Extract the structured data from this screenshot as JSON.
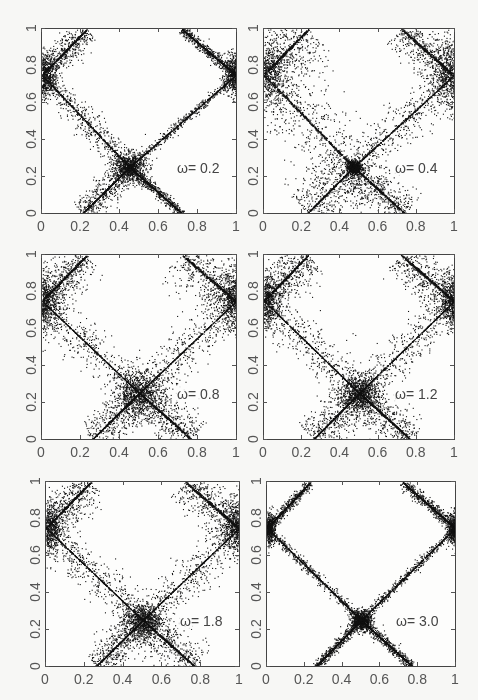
{
  "figure": {
    "background": "#f7f7f5",
    "ink": "#111111",
    "axis_color": "#444444"
  },
  "chart_data": [
    {
      "type": "scatter",
      "title": "",
      "annotation": "ω= 0.2",
      "omega": 0.2,
      "xlim": [
        0,
        1
      ],
      "ylim": [
        0,
        1
      ],
      "xticks": [
        "0",
        "0.2",
        "0.4",
        "0.6",
        "0.8",
        "1"
      ],
      "yticks": [
        "0",
        "0.2",
        "0.4",
        "0.6",
        "0.8",
        "1"
      ],
      "xlabel": "",
      "ylabel": "",
      "grid": false,
      "description": "X-shaped separatrix band: lines crossing at (0.45,0.25) and (0.0/1.0, 0.75); dense cluster near crossing",
      "bands": {
        "left_width": 0.035,
        "right_width": 0.012,
        "center_blob": 0.07,
        "edge_blob": 0.06
      },
      "frame": {
        "x": 41,
        "y": 28,
        "w": 196,
        "h": 186
      }
    },
    {
      "type": "scatter",
      "title": "",
      "annotation": "ω= 0.4",
      "omega": 0.4,
      "xlim": [
        0,
        1
      ],
      "ylim": [
        0,
        1
      ],
      "xticks": [
        "0",
        "0.2",
        "0.4",
        "0.6",
        "0.8",
        "1"
      ],
      "yticks": [
        "0",
        "0.2",
        "0.4",
        "0.6",
        "0.8",
        "1"
      ],
      "xlabel": "",
      "ylabel": "",
      "grid": false,
      "description": "Broad diffuse bands; left arm curves around x≈0.3; thin crossing line near (0.47,0.25)",
      "bands": {
        "left_width": 0.09,
        "right_width": 0.05,
        "center_blob": 0.03,
        "edge_blob": 0.1
      },
      "frame": {
        "x": 263,
        "y": 28,
        "w": 192,
        "h": 186
      }
    },
    {
      "type": "scatter",
      "title": "",
      "annotation": "ω= 0.8",
      "omega": 0.8,
      "xlim": [
        0,
        1
      ],
      "ylim": [
        0,
        1
      ],
      "xticks": [
        "0",
        "0.2",
        "0.4",
        "0.6",
        "0.8",
        "1"
      ],
      "yticks": [
        "0",
        "0.2",
        "0.4",
        "0.6",
        "0.8",
        "1"
      ],
      "xlabel": "",
      "ylabel": "",
      "grid": false,
      "description": "Wide chaotic bands; large dense blob centered near (0.5,0.25)",
      "bands": {
        "left_width": 0.05,
        "right_width": 0.06,
        "center_blob": 0.1,
        "edge_blob": 0.08
      },
      "frame": {
        "x": 41,
        "y": 254,
        "w": 196,
        "h": 186
      }
    },
    {
      "type": "scatter",
      "title": "",
      "annotation": "ω= 1.2",
      "omega": 1.2,
      "xlim": [
        0,
        1
      ],
      "ylim": [
        0,
        1
      ],
      "xticks": [
        "0",
        "0.2",
        "0.4",
        "0.6",
        "0.8",
        "1"
      ],
      "yticks": [
        "0",
        "0.2",
        "0.4",
        "0.6",
        "0.8",
        "1"
      ],
      "xlabel": "",
      "ylabel": "",
      "grid": false,
      "description": "Split double-strand bands; crossing cluster near (0.5,0.25)",
      "bands": {
        "left_width": 0.055,
        "right_width": 0.05,
        "center_blob": 0.08,
        "edge_blob": 0.07
      },
      "frame": {
        "x": 263,
        "y": 254,
        "w": 192,
        "h": 186
      }
    },
    {
      "type": "scatter",
      "title": "",
      "annotation": "ω= 1.8",
      "omega": 1.8,
      "xlim": [
        0,
        1
      ],
      "ylim": [
        0,
        1
      ],
      "xticks": [
        "0",
        "0.2",
        "0.4",
        "0.6",
        "0.8",
        "1"
      ],
      "yticks": [
        "0",
        "0.2",
        "0.4",
        "0.6",
        "0.8",
        "1"
      ],
      "xlabel": "",
      "ylabel": "",
      "grid": false,
      "description": "Bands with internal stripes; crossing cluster near (0.52,0.25)",
      "bands": {
        "left_width": 0.05,
        "right_width": 0.05,
        "center_blob": 0.08,
        "edge_blob": 0.07
      },
      "frame": {
        "x": 45,
        "y": 481,
        "w": 195,
        "h": 186
      }
    },
    {
      "type": "scatter",
      "title": "",
      "annotation": "ω= 3.0",
      "omega": 3.0,
      "xlim": [
        0,
        1
      ],
      "ylim": [
        0,
        1
      ],
      "xticks": [
        "0",
        "0.2",
        "0.4",
        "0.6",
        "0.8",
        "1"
      ],
      "yticks": [
        "0",
        "0.2",
        "0.4",
        "0.6",
        "0.8",
        "1"
      ],
      "xlabel": "",
      "ylabel": "",
      "grid": false,
      "description": "Thin sharp separatrix lines; tight dense cluster at (0.5,0.25) and at (0/1,0.75)",
      "bands": {
        "left_width": 0.012,
        "right_width": 0.012,
        "center_blob": 0.045,
        "edge_blob": 0.04
      },
      "frame": {
        "x": 266,
        "y": 481,
        "w": 190,
        "h": 186
      }
    }
  ]
}
